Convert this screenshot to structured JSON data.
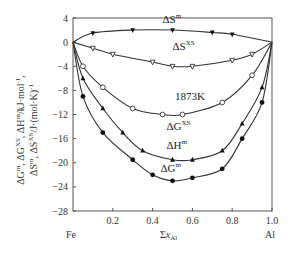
{
  "chart_data": {
    "type": "line",
    "title": "",
    "annotation": "1873K",
    "xlabel": "Σx_Al",
    "x_endpoint_labels": {
      "left": "Fe",
      "right": "Al"
    },
    "ylabel_line1": "ΔG^m, ΔG^XS, ΔH^m/kJ·mol^-1,",
    "ylabel_line2": "ΔS^m, ΔS^XS/J·(mol·K)^-1",
    "xlim": [
      0,
      1.0
    ],
    "ylim": [
      -28,
      4
    ],
    "x_ticks": [
      0.2,
      0.4,
      0.6,
      0.8,
      1.0
    ],
    "x_tick_labels": [
      "0.2",
      "0.4",
      "0.6",
      "0.8",
      "1.0"
    ],
    "y_ticks": [
      4,
      0,
      -4,
      -8,
      -12,
      -16,
      -20,
      -24,
      -28
    ],
    "y_tick_labels": [
      "4",
      "0",
      "-4",
      "-8",
      "-12",
      "-16",
      "-20",
      "-24",
      "-28"
    ],
    "grid": false,
    "legend": "inline labels next to curves",
    "series": [
      {
        "name": "ΔS^m",
        "label_main": "ΔS",
        "label_sup": "m",
        "marker": "filled-down-triangle",
        "x": [
          0,
          0.1,
          0.3,
          0.5,
          0.7,
          0.8,
          1.0
        ],
        "y": [
          0,
          1.5,
          2.0,
          2.0,
          1.6,
          1.3,
          0
        ],
        "label_pos": [
          0.45,
          3.2
        ]
      },
      {
        "name": "ΔS^XS",
        "label_main": "ΔS",
        "label_sup": "XS",
        "marker": "open-down-triangle",
        "x": [
          0,
          0.1,
          0.2,
          0.4,
          0.5,
          0.6,
          0.8,
          0.9,
          1.0
        ],
        "y": [
          0,
          -1.0,
          -2.0,
          -3.3,
          -4.0,
          -4.0,
          -3.0,
          -2.0,
          0
        ],
        "label_pos": [
          0.5,
          -1.3
        ]
      },
      {
        "name": "ΔG^XS",
        "label_main": "ΔG",
        "label_sup": "XS",
        "marker": "open-circle",
        "x": [
          0,
          0.05,
          0.15,
          0.3,
          0.45,
          0.55,
          0.75,
          0.9,
          1.0
        ],
        "y": [
          0,
          -4.0,
          -7.5,
          -11.0,
          -12.0,
          -12.0,
          -10.0,
          -5.5,
          0
        ],
        "label_pos": [
          0.47,
          -14.5
        ]
      },
      {
        "name": "ΔH^m",
        "label_main": "ΔH",
        "label_sup": "m",
        "marker": "filled-triangle",
        "x": [
          0,
          0.05,
          0.15,
          0.25,
          0.35,
          0.5,
          0.6,
          0.75,
          0.85,
          0.95,
          1.0
        ],
        "y": [
          0,
          -6.0,
          -11.0,
          -15.0,
          -18.0,
          -19.5,
          -19.5,
          -18.0,
          -13.5,
          -7.5,
          0
        ],
        "label_pos": [
          0.47,
          -17.8
        ]
      },
      {
        "name": "ΔG^m",
        "label_main": "ΔG",
        "label_sup": "m",
        "marker": "filled-circle",
        "x": [
          0,
          0.05,
          0.15,
          0.3,
          0.4,
          0.5,
          0.6,
          0.75,
          0.85,
          0.95,
          1.0
        ],
        "y": [
          0,
          -9.0,
          -15.0,
          -19.5,
          -22.0,
          -23.0,
          -22.5,
          -21.0,
          -16.0,
          -10.0,
          0
        ],
        "label_pos": [
          0.44,
          -21.5
        ]
      }
    ]
  }
}
